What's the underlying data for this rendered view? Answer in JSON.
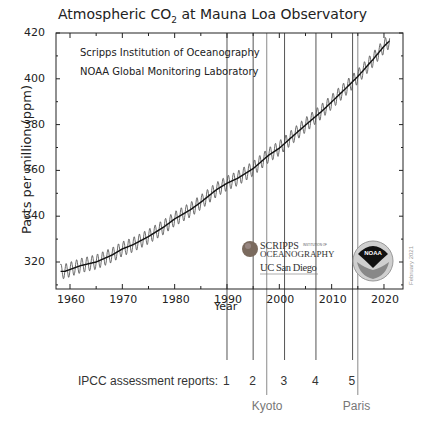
{
  "chart_data": {
    "type": "line",
    "title": "Atmospheric CO",
    "title_subscript": "2",
    "title_suffix": " at Mauna Loa Observatory",
    "xlabel": "Year",
    "ylabel": "Parts per million (ppm)",
    "xlim": [
      1957.4,
      2023.3
    ],
    "ylim": [
      308,
      421
    ],
    "x_ticks": [
      1960,
      1970,
      1980,
      1990,
      2000,
      2010,
      2020
    ],
    "y_ticks": [
      320,
      340,
      360,
      380,
      400,
      420
    ],
    "grid": false,
    "series": [
      {
        "name": "Annual mean CO2 (trend)",
        "x": [
          1959,
          1962,
          1965,
          1968,
          1970,
          1972,
          1975,
          1978,
          1980,
          1983,
          1985,
          1988,
          1990,
          1992,
          1995,
          1998,
          2000,
          2003,
          2005,
          2008,
          2010,
          2013,
          2015,
          2018,
          2020,
          2021
        ],
        "values": [
          315.9,
          318.4,
          320.0,
          323.0,
          325.7,
          327.5,
          331.1,
          335.4,
          338.8,
          342.8,
          346.1,
          351.6,
          354.4,
          356.5,
          360.8,
          366.7,
          369.7,
          375.8,
          379.8,
          385.6,
          389.9,
          396.5,
          401.0,
          408.7,
          414.2,
          416.4
        ]
      },
      {
        "name": "Monthly CO2 (seasonal cycle)",
        "seasonal_amplitude_ppm": 3.2
      }
    ],
    "annotations": {
      "ipcc_label": "IPCC assessment reports:",
      "ipcc_reports": [
        {
          "label": "1",
          "year": 1990
        },
        {
          "label": "2",
          "year": 1995
        },
        {
          "label": "3",
          "year": 2001
        },
        {
          "label": "4",
          "year": 2007
        },
        {
          "label": "5",
          "year": 2014
        }
      ],
      "treaties": [
        {
          "label": "Kyoto",
          "year": 1997.6
        },
        {
          "label": "Paris",
          "year": 2015
        }
      ],
      "sources": [
        "Scripps Institution of Oceanography",
        "NOAA Global Monitoring Laboratory"
      ],
      "date_stamp": "February 2021"
    }
  },
  "logos": {
    "scripps_line1": "SCRIPPS",
    "scripps_small": "INSTITUTION OF",
    "scripps_line2": "OCEANOGRAPHY",
    "ucsd": "UC San Diego",
    "noaa": "NOAA"
  },
  "colors": {
    "axis": "#222222",
    "line": "#111111",
    "treaty_line": "#8a8a8a",
    "treaty_text": "#777777",
    "ipcc_text": "#333333"
  }
}
